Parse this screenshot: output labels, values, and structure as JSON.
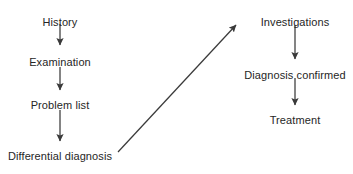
{
  "diagram": {
    "background_color": "#ffffff",
    "text_color": "#262626",
    "line_color": "#3a3a3a",
    "nodes": [
      {
        "id": "history",
        "label": "History",
        "x": 60,
        "y": 16
      },
      {
        "id": "examination",
        "label": "Examination",
        "x": 60,
        "y": 56
      },
      {
        "id": "problem-list",
        "label": "Problem list",
        "x": 60,
        "y": 99
      },
      {
        "id": "differential",
        "label": "Differential diagnosis",
        "x": 60,
        "y": 150
      },
      {
        "id": "investigations",
        "label": "Investigations",
        "x": 295,
        "y": 16
      },
      {
        "id": "diagnosis-confirmed",
        "label": "Diagnosis confirmed",
        "x": 295,
        "y": 69
      },
      {
        "id": "treatment",
        "label": "Treatment",
        "x": 295,
        "y": 114
      }
    ],
    "connectors": [
      {
        "id": "history-to-examination",
        "from": "history",
        "to": "examination",
        "x1": 60,
        "y1": 24,
        "x2": 60,
        "y2": 45,
        "kind": "vertical"
      },
      {
        "id": "examination-to-problem-list",
        "from": "examination",
        "to": "problem-list",
        "x1": 60,
        "y1": 67,
        "x2": 60,
        "y2": 90,
        "kind": "vertical"
      },
      {
        "id": "problem-list-to-differential",
        "from": "problem-list",
        "to": "differential",
        "x1": 60,
        "y1": 110,
        "x2": 60,
        "y2": 141,
        "kind": "vertical"
      },
      {
        "id": "differential-to-investigations",
        "from": "differential",
        "to": "investigations",
        "x1": 118,
        "y1": 152,
        "x2": 236,
        "y2": 25,
        "kind": "diagonal"
      },
      {
        "id": "investigations-to-diagnosis",
        "from": "investigations",
        "to": "diagnosis-confirmed",
        "x1": 295,
        "y1": 25,
        "x2": 295,
        "y2": 59,
        "kind": "vertical"
      },
      {
        "id": "diagnosis-to-treatment",
        "from": "diagnosis-confirmed",
        "to": "treatment",
        "x1": 295,
        "y1": 78,
        "x2": 295,
        "y2": 105,
        "kind": "vertical"
      }
    ]
  }
}
